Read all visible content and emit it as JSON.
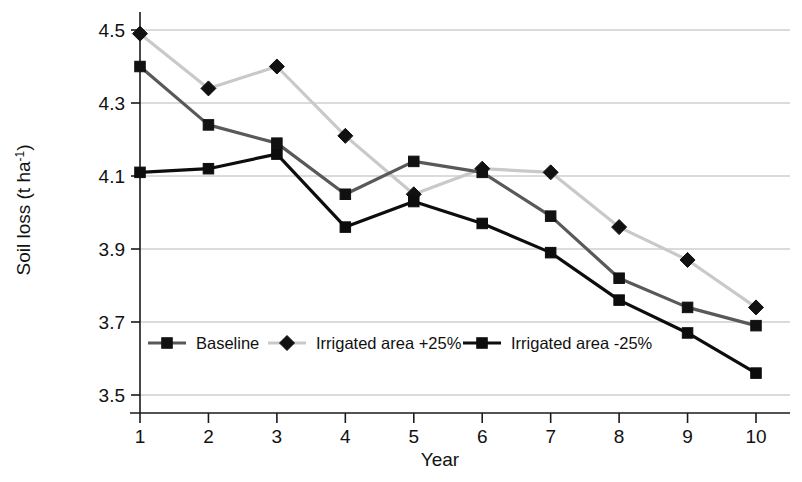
{
  "chart_data": {
    "type": "line",
    "title": "",
    "xlabel": "Year",
    "ylabel": "Soil loss (t ha-1)",
    "ylabel_base": "Soil loss (t ha",
    "ylabel_sup": "-1",
    "ylabel_close": ")",
    "categories": [
      1,
      2,
      3,
      4,
      5,
      6,
      7,
      8,
      9,
      10
    ],
    "x": [
      1,
      2,
      3,
      4,
      5,
      6,
      7,
      8,
      9,
      10
    ],
    "xtick_labels": [
      "1",
      "2",
      "3",
      "4",
      "5",
      "6",
      "7",
      "8",
      "9",
      "10"
    ],
    "ytick_labels": [
      "3.5",
      "3.7",
      "3.9",
      "4.1",
      "4.3",
      "4.5"
    ],
    "yticks": [
      3.5,
      3.7,
      3.9,
      4.1,
      4.3,
      4.5
    ],
    "ylim": [
      3.5,
      4.5
    ],
    "xlim": [
      1,
      10
    ],
    "grid": "horizontal",
    "legend_position": "inside-bottom-left",
    "series": [
      {
        "name": "Baseline",
        "marker": "square",
        "color": "#595959",
        "marker_color": "#111111",
        "values": [
          4.4,
          4.24,
          4.19,
          4.05,
          4.14,
          4.11,
          3.99,
          3.82,
          3.74,
          3.69
        ]
      },
      {
        "name": "Irrigated area +25%",
        "marker": "diamond",
        "color": "#c9c9c9",
        "marker_color": "#111111",
        "values": [
          4.49,
          4.34,
          4.4,
          4.21,
          4.05,
          4.12,
          4.11,
          3.96,
          3.87,
          3.74
        ]
      },
      {
        "name": "Irrigated area -25%",
        "marker": "square",
        "color": "#0d0d0d",
        "marker_color": "#0d0d0d",
        "values": [
          4.11,
          4.12,
          4.16,
          3.96,
          4.03,
          3.97,
          3.89,
          3.76,
          3.67,
          3.56
        ]
      }
    ],
    "legend": [
      {
        "label": "Baseline",
        "marker": "square",
        "line_color": "#595959",
        "marker_color": "#111111"
      },
      {
        "label": "Irrigated area +25%",
        "marker": "diamond",
        "line_color": "#c9c9c9",
        "marker_color": "#111111"
      },
      {
        "label": "Irrigated area -25%",
        "marker": "square",
        "line_color": "#0d0d0d",
        "marker_color": "#0d0d0d"
      }
    ],
    "colors": {
      "axis": "#1a1a1a",
      "grid": "#b7b7b7",
      "background": "#ffffff"
    }
  }
}
